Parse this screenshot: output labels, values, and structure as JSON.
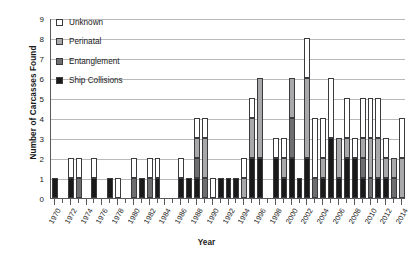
{
  "chart_data": {
    "type": "bar",
    "title": "",
    "xlabel": "Year",
    "ylabel": "Number of Carcasses Found",
    "ylim": [
      0,
      9
    ],
    "ytick_labels": [
      "0",
      "1",
      "2",
      "3",
      "4",
      "5",
      "6",
      "7",
      "8",
      "9"
    ],
    "grid": true,
    "stacked": true,
    "legend_position": "top-left",
    "legend": [
      "Unknown",
      "Perinatal",
      "Entanglement",
      "Ship Collisions"
    ],
    "series_colors": {
      "Unknown": "#ffffff",
      "Perinatal": "#a8a8aa",
      "Entanglement": "#6e6e70",
      "Ship Collisions": "#1a1a1a"
    },
    "categories": [
      "1970",
      "1971",
      "1972",
      "1973",
      "1974",
      "1975",
      "1976",
      "1977",
      "1978",
      "1979",
      "1980",
      "1981",
      "1982",
      "1983",
      "1984",
      "1985",
      "1986",
      "1987",
      "1988",
      "1989",
      "1990",
      "1991",
      "1992",
      "1993",
      "1994",
      "1995",
      "1996",
      "1997",
      "1998",
      "1999",
      "2000",
      "2001",
      "2002",
      "2003",
      "2004",
      "2005",
      "2006",
      "2007",
      "2008",
      "2009",
      "2010",
      "2011",
      "2012",
      "2013",
      "2014"
    ],
    "axis_tick_labels": [
      "1970",
      "1972",
      "1974",
      "1976",
      "1978",
      "1980",
      "1982",
      "1984",
      "1986",
      "1988",
      "1990",
      "1992",
      "1994",
      "1996",
      "1998",
      "2000",
      "2002",
      "2004",
      "2006",
      "2008",
      "2010",
      "2012",
      "2014"
    ],
    "series": [
      {
        "name": "Ship Collisions",
        "values": [
          1,
          0,
          1,
          0,
          0,
          1,
          0,
          1,
          0,
          0,
          0,
          1,
          0,
          1,
          0,
          0,
          1,
          1,
          1,
          0,
          0,
          1,
          1,
          1,
          0,
          2,
          2,
          0,
          2,
          1,
          2,
          1,
          2,
          0,
          1,
          3,
          1,
          2,
          2,
          1,
          0,
          1,
          1,
          0,
          0
        ]
      },
      {
        "name": "Entanglement",
        "values": [
          0,
          0,
          0,
          1,
          0,
          0,
          0,
          0,
          0,
          0,
          1,
          0,
          1,
          0,
          0,
          0,
          0,
          0,
          1,
          1,
          0,
          0,
          0,
          0,
          0,
          0,
          0,
          0,
          0,
          0,
          2,
          0,
          0,
          1,
          0,
          0,
          0,
          0,
          0,
          1,
          1,
          0,
          0,
          1,
          0
        ]
      },
      {
        "name": "Perinatal",
        "values": [
          0,
          0,
          0,
          0,
          0,
          0,
          0,
          0,
          0,
          0,
          0,
          0,
          0,
          0,
          0,
          0,
          0,
          0,
          1,
          2,
          0,
          0,
          0,
          0,
          1,
          2,
          4,
          0,
          0,
          1,
          2,
          0,
          4,
          0,
          1,
          0,
          2,
          1,
          0,
          1,
          2,
          2,
          1,
          1,
          2
        ]
      },
      {
        "name": "Unknown",
        "values": [
          0,
          0,
          1,
          1,
          0,
          1,
          0,
          0,
          1,
          0,
          1,
          0,
          1,
          1,
          0,
          0,
          1,
          0,
          1,
          1,
          1,
          0,
          0,
          0,
          1,
          1,
          0,
          0,
          1,
          1,
          0,
          0,
          2,
          3,
          2,
          3,
          0,
          2,
          1,
          2,
          2,
          2,
          1,
          0,
          2
        ]
      }
    ]
  }
}
